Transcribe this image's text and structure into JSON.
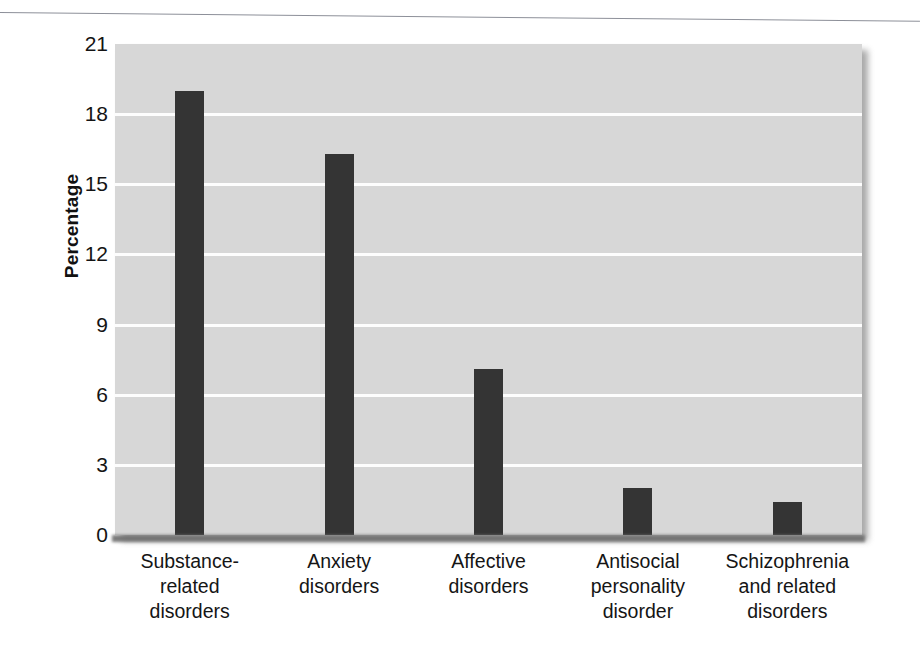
{
  "chart_data": {
    "type": "bar",
    "title": "",
    "subtitle": "",
    "xlabel": "",
    "ylabel": "Percentage",
    "ylim": [
      0,
      21
    ],
    "yticks": [
      0,
      3,
      6,
      9,
      12,
      15,
      18,
      21
    ],
    "ytick_labels": [
      "0",
      "3",
      "6",
      "9",
      "12",
      "15",
      "18",
      "21"
    ],
    "grid": true,
    "legend": "none",
    "categories": [
      "Substance-related disorders",
      "Anxiety disorders",
      "Affective disorders",
      "Antisocial personality disorder",
      "Schizophrenia and related disorders"
    ],
    "category_lines": [
      [
        "Substance-",
        "related",
        "disorders"
      ],
      [
        "Anxiety",
        "disorders"
      ],
      [
        "Affective",
        "disorders"
      ],
      [
        "Antisocial",
        "personality",
        "disorder"
      ],
      [
        "Schizophrenia",
        "and related",
        "disorders"
      ]
    ],
    "values": [
      19.0,
      16.3,
      7.1,
      2.0,
      1.4
    ],
    "colors": {
      "bar": "#343434",
      "plot_background": "#d7d7d7",
      "gridline": "#fdfdfd",
      "axis": "#6e6e6e",
      "text": "#151515",
      "page_background": "#ffffff"
    }
  }
}
